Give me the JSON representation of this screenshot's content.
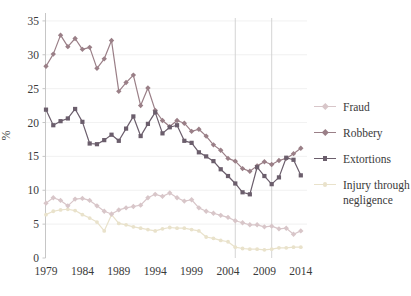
{
  "chart_data": {
    "type": "line",
    "title": "",
    "xlabel": "",
    "ylabel": "%",
    "ylim": [
      0,
      35
    ],
    "yticks": [
      0,
      5,
      10,
      15,
      20,
      25,
      30,
      35
    ],
    "xticks": [
      1979,
      1984,
      1989,
      1994,
      1999,
      2004,
      2009,
      2014
    ],
    "vertical_reference_lines": [
      2005,
      2010
    ],
    "grid": {
      "horizontal": true
    },
    "legend_position": "right",
    "x": [
      1979,
      1980,
      1981,
      1982,
      1983,
      1984,
      1985,
      1986,
      1987,
      1988,
      1989,
      1990,
      1991,
      1992,
      1993,
      1994,
      1995,
      1996,
      1997,
      1998,
      1999,
      2000,
      2001,
      2002,
      2003,
      2004,
      2005,
      2006,
      2007,
      2008,
      2009,
      2010,
      2011,
      2012,
      2013,
      2014
    ],
    "series": [
      {
        "name": "Fraud",
        "color": "#d8c6c9",
        "marker": "diamond",
        "values": [
          8.1,
          8.9,
          8.5,
          7.7,
          8.7,
          8.8,
          8.5,
          7.7,
          6.9,
          6.5,
          7.1,
          7.4,
          7.6,
          7.8,
          8.9,
          9.4,
          9.1,
          9.6,
          8.9,
          8.4,
          8.6,
          7.4,
          6.9,
          6.6,
          6.3,
          6.0,
          5.5,
          5.2,
          4.9,
          4.9,
          4.6,
          4.7,
          4.3,
          4.4,
          3.5,
          4.0
        ]
      },
      {
        "name": "Robbery",
        "color": "#9a7f87",
        "marker": "diamond",
        "values": [
          28.3,
          30.1,
          32.9,
          31.2,
          32.4,
          30.8,
          31.1,
          28.0,
          29.4,
          32.1,
          24.6,
          25.9,
          27.0,
          22.5,
          25.1,
          21.8,
          20.3,
          19.4,
          20.3,
          19.9,
          18.7,
          19.0,
          18.0,
          16.7,
          15.9,
          14.7,
          14.3,
          13.2,
          12.8,
          13.6,
          14.2,
          13.8,
          14.4,
          14.7,
          15.4,
          16.2
        ]
      },
      {
        "name": "Extortions",
        "color": "#6b5e6c",
        "marker": "square",
        "values": [
          21.9,
          19.6,
          20.2,
          20.6,
          22.0,
          20.1,
          16.9,
          16.8,
          17.4,
          18.2,
          17.3,
          19.1,
          20.9,
          18.0,
          19.8,
          21.5,
          18.4,
          19.3,
          19.6,
          17.3,
          17.0,
          15.6,
          15.0,
          14.3,
          13.1,
          12.1,
          11.0,
          9.7,
          9.4,
          13.4,
          12.1,
          10.9,
          11.9,
          14.8,
          14.5,
          12.2
        ]
      },
      {
        "name": "Injury through negligence",
        "color": "#e9e2cb",
        "marker": "circle",
        "values": [
          6.4,
          6.9,
          7.1,
          7.2,
          7.0,
          6.4,
          5.9,
          5.3,
          4.0,
          6.4,
          5.1,
          4.9,
          4.6,
          4.4,
          4.2,
          4.0,
          4.3,
          4.5,
          4.4,
          4.4,
          4.2,
          4.0,
          3.1,
          2.9,
          2.6,
          2.4,
          1.6,
          1.4,
          1.3,
          1.3,
          1.2,
          1.3,
          1.5,
          1.5,
          1.6,
          1.6
        ]
      }
    ]
  },
  "style": {
    "background": "#ffffff",
    "text_color": "#3a3a3a",
    "horizontal_grid_color": "#ededed",
    "vertical_line_color": "#cfcfcf",
    "axis_spine_color": "#c6c6c6"
  }
}
